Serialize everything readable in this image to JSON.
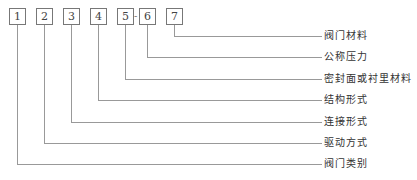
{
  "diagram": {
    "boxes": [
      {
        "num": "1",
        "label": "阀门类别"
      },
      {
        "num": "2",
        "label": "驱动方式"
      },
      {
        "num": "3",
        "label": "连接形式"
      },
      {
        "num": "4",
        "label": "结构形式"
      },
      {
        "num": "5",
        "label": "密封面或衬里材料"
      },
      {
        "num": "6",
        "label": "公称压力"
      },
      {
        "num": "7",
        "label": "阀门材料"
      }
    ],
    "separator": "-"
  }
}
